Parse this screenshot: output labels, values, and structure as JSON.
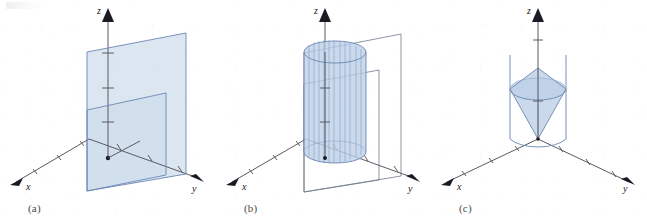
{
  "figure": {
    "background_color": "#ffffff",
    "surface_fill_color": "#cfdcea",
    "surface_edge_color": "#6b87b3",
    "axis_color": "#5a5a62",
    "label_color": "#1a1a24"
  },
  "panels": [
    {
      "caption": "(a)",
      "name": "intersecting-planes",
      "description": "Two parallel vertical planes intersecting the three-dimensional axes",
      "axes": [
        {
          "name": "x",
          "label": "x",
          "ticks": 3
        },
        {
          "name": "y",
          "label": "y",
          "ticks": 3
        },
        {
          "name": "z",
          "label": "z",
          "ticks": 3
        }
      ],
      "surfaces": [
        {
          "kind": "plane",
          "style": "filled",
          "name": "front-plane"
        },
        {
          "kind": "plane",
          "style": "filled",
          "name": "back-plane"
        }
      ]
    },
    {
      "caption": "(b)",
      "name": "cylinder-with-planes",
      "description": "A vertical circular cylinder drawn with ruling lines, plus two outlined planes behind it",
      "axes": [
        {
          "name": "x",
          "label": "x",
          "ticks": 3
        },
        {
          "name": "y",
          "label": "y",
          "ticks": 3
        },
        {
          "name": "z",
          "label": "z",
          "ticks": 3
        }
      ],
      "surfaces": [
        {
          "kind": "cylinder",
          "style": "filled-ruled",
          "name": "cylinder"
        },
        {
          "kind": "plane",
          "style": "outline",
          "name": "near-plane-outline"
        },
        {
          "kind": "plane",
          "style": "outline",
          "name": "far-plane-outline"
        }
      ]
    },
    {
      "caption": "(c)",
      "name": "double-cone",
      "description": "A double cone with apex at the origin, bounded by two vertical lines and a circular arc",
      "axes": [
        {
          "name": "x",
          "label": "x",
          "ticks": 3
        },
        {
          "name": "y",
          "label": "y",
          "ticks": 3
        },
        {
          "name": "z",
          "label": "z",
          "ticks": 3
        }
      ],
      "surfaces": [
        {
          "kind": "cone",
          "style": "filled",
          "name": "upper-cone"
        },
        {
          "kind": "cone",
          "style": "filled",
          "name": "lower-cone"
        },
        {
          "kind": "line",
          "style": "outline",
          "name": "left-vertical-line"
        },
        {
          "kind": "line",
          "style": "outline",
          "name": "right-vertical-line"
        },
        {
          "kind": "arc",
          "style": "outline",
          "name": "base-arc"
        }
      ]
    }
  ]
}
